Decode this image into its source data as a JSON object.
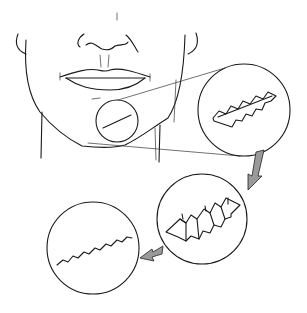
{
  "diagram": {
    "panels": [
      {
        "id": "face",
        "description": "Lower face with linear scar on chin (circled)"
      },
      {
        "id": "magnified-excision",
        "description": "Magnified scar with zigzag W-plasty excision outline"
      },
      {
        "id": "flaps-closure",
        "description": "Interdigitating triangular flaps being advanced"
      },
      {
        "id": "final-result",
        "description": "Resulting zigzag closure line"
      }
    ],
    "colors": {
      "ink": "#1a1a1a",
      "arrow_fill": "#9a9a9a",
      "background": "#ffffff"
    }
  }
}
